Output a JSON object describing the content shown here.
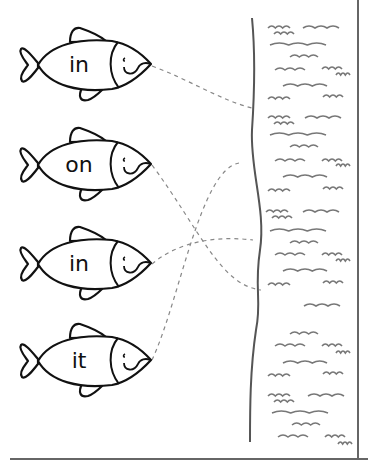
{
  "worksheet": {
    "fish": [
      {
        "word": "in",
        "cy": 65
      },
      {
        "word": "on",
        "cy": 165
      },
      {
        "word": "in",
        "cy": 264
      },
      {
        "word": "it",
        "cy": 361
      }
    ],
    "matches": [
      {
        "from_fish": 0,
        "to": [
          252,
          108
        ]
      },
      {
        "from_fish": 1,
        "to": [
          261,
          290
        ]
      },
      {
        "from_fish": 2,
        "to": [
          253,
          240
        ]
      },
      {
        "from_fish": 3,
        "to": [
          239,
          163
        ]
      }
    ]
  },
  "colors": {
    "ink": "#111111",
    "water": "#777777",
    "dash": "#888888",
    "border": "#666666"
  }
}
